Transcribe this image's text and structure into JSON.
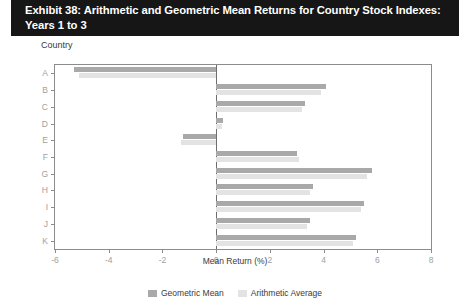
{
  "exhibit": {
    "title": "Exhibit 38: Arithmetic and Geometric Mean Returns for Country Stock Indexes: Years 1 to 3"
  },
  "axis_group_label": "Country",
  "legend": {
    "geometric": {
      "label": "Geometric Mean",
      "color": "#a9a9a9"
    },
    "arithmetic": {
      "label": "Arithmetic Average",
      "color": "#e3e3e3"
    }
  },
  "chart_data": {
    "type": "bar",
    "orientation": "horizontal",
    "title": "Exhibit 38: Arithmetic and Geometric Mean Returns for Country Stock Indexes: Years 1 to 3",
    "xlabel": "Mean Return (%)",
    "ylabel": "Country",
    "xlim": [
      -6,
      8
    ],
    "xticks": [
      -6,
      -4,
      -2,
      0,
      2,
      4,
      6,
      8
    ],
    "xticklabels": [
      "-6",
      "-4",
      "-2",
      "0",
      "2",
      "4",
      "6",
      "8"
    ],
    "grid": false,
    "legend_position": "bottom",
    "categories": [
      "A",
      "B",
      "C",
      "D",
      "E",
      "F",
      "G",
      "H",
      "I",
      "J",
      "K"
    ],
    "series": [
      {
        "name": "Geometric Mean",
        "color": "#a9a9a9",
        "values": [
          -5.3,
          4.1,
          3.3,
          0.25,
          -1.25,
          3.0,
          5.8,
          3.6,
          5.5,
          3.5,
          5.2
        ]
      },
      {
        "name": "Arithmetic Average",
        "color": "#e3e3e3",
        "values": [
          -5.1,
          3.9,
          3.2,
          0.2,
          -1.3,
          3.1,
          5.6,
          3.5,
          5.4,
          3.4,
          5.1
        ]
      }
    ]
  }
}
